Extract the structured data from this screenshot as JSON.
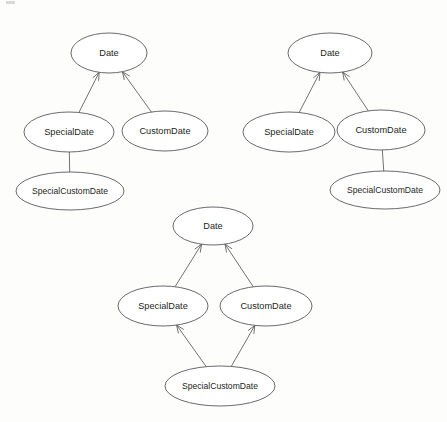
{
  "figure": {
    "background_color": "#fdfdfc",
    "node_fill": "#ffffff",
    "node_stroke": "#58595b",
    "label_color": "#231f20"
  },
  "diagrams": [
    {
      "id": "diagram-single-inheritance-special",
      "name": "Single inheritance via SpecialDate",
      "nodes": [
        {
          "id": "d1-date",
          "label": "Date",
          "cx": 109,
          "cy": 53,
          "rx": 38,
          "ry": 20
        },
        {
          "id": "d1-specialdate",
          "label": "SpecialDate",
          "cx": 69,
          "cy": 132,
          "rx": 45,
          "ry": 20
        },
        {
          "id": "d1-customdate",
          "label": "CustomDate",
          "cx": 165,
          "cy": 131,
          "rx": 43,
          "ry": 20
        },
        {
          "id": "d1-specialcustomdate",
          "label": "SpecialCustomDate",
          "cx": 70,
          "cy": 191,
          "rx": 54,
          "ry": 19
        }
      ],
      "edges": [
        {
          "id": "d1-edge-special-to-date",
          "from": "d1-specialdate",
          "to": "d1-date",
          "arrow": true
        },
        {
          "id": "d1-edge-custom-to-date",
          "from": "d1-customdate",
          "to": "d1-date",
          "arrow": true
        },
        {
          "id": "d1-edge-specialcustom-to-special",
          "from": "d1-specialcustomdate",
          "to": "d1-specialdate",
          "arrow": false
        }
      ]
    },
    {
      "id": "diagram-single-inheritance-custom",
      "name": "Single inheritance via CustomDate",
      "nodes": [
        {
          "id": "d2-date",
          "label": "Date",
          "cx": 330,
          "cy": 53,
          "rx": 42,
          "ry": 20
        },
        {
          "id": "d2-specialdate",
          "label": "SpecialDate",
          "cx": 289,
          "cy": 132,
          "rx": 46,
          "ry": 20
        },
        {
          "id": "d2-customdate",
          "label": "CustomDate",
          "cx": 381,
          "cy": 130,
          "rx": 44,
          "ry": 20
        },
        {
          "id": "d2-specialcustomdate",
          "label": "SpecialCustomDate",
          "cx": 385,
          "cy": 190,
          "rx": 55,
          "ry": 19
        }
      ],
      "edges": [
        {
          "id": "d2-edge-special-to-date",
          "from": "d2-specialdate",
          "to": "d2-date",
          "arrow": true
        },
        {
          "id": "d2-edge-custom-to-date",
          "from": "d2-customdate",
          "to": "d2-date",
          "arrow": true
        },
        {
          "id": "d2-edge-specialcustom-to-custom",
          "from": "d2-specialcustomdate",
          "to": "d2-customdate",
          "arrow": false
        }
      ]
    },
    {
      "id": "diagram-multiple-inheritance",
      "name": "Multiple inheritance diamond",
      "nodes": [
        {
          "id": "d3-date",
          "label": "Date",
          "cx": 213,
          "cy": 226,
          "rx": 40,
          "ry": 19
        },
        {
          "id": "d3-specialdate",
          "label": "SpecialDate",
          "cx": 163,
          "cy": 306,
          "rx": 45,
          "ry": 20
        },
        {
          "id": "d3-customdate",
          "label": "CustomDate",
          "cx": 266,
          "cy": 306,
          "rx": 46,
          "ry": 20
        },
        {
          "id": "d3-specialcustomdate",
          "label": "SpecialCustomDate",
          "cx": 220,
          "cy": 386,
          "rx": 55,
          "ry": 20
        }
      ],
      "edges": [
        {
          "id": "d3-edge-special-to-date",
          "from": "d3-specialdate",
          "to": "d3-date",
          "arrow": true
        },
        {
          "id": "d3-edge-custom-to-date",
          "from": "d3-customdate",
          "to": "d3-date",
          "arrow": true
        },
        {
          "id": "d3-edge-specialcustom-to-special",
          "from": "d3-specialcustomdate",
          "to": "d3-specialdate",
          "arrow": true
        },
        {
          "id": "d3-edge-specialcustom-to-custom",
          "from": "d3-specialcustomdate",
          "to": "d3-customdate",
          "arrow": true
        }
      ]
    }
  ]
}
